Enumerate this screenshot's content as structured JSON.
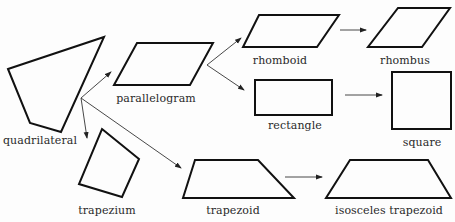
{
  "diagram": {
    "nodes": [
      {
        "id": "quadrilateral",
        "label": "quadrilateral"
      },
      {
        "id": "parallelogram",
        "label": "parallelogram"
      },
      {
        "id": "trapezium",
        "label": "trapezium"
      },
      {
        "id": "trapezoid",
        "label": "trapezoid"
      },
      {
        "id": "rhomboid",
        "label": "rhomboid"
      },
      {
        "id": "rectangle",
        "label": "rectangle"
      },
      {
        "id": "rhombus",
        "label": "rhombus"
      },
      {
        "id": "square",
        "label": "square"
      },
      {
        "id": "isosceles_trapezoid",
        "label": "isosceles trapezoid"
      }
    ],
    "edges": [
      {
        "from": "quadrilateral",
        "to": "parallelogram"
      },
      {
        "from": "quadrilateral",
        "to": "trapezium"
      },
      {
        "from": "quadrilateral",
        "to": "trapezoid"
      },
      {
        "from": "parallelogram",
        "to": "rhomboid"
      },
      {
        "from": "parallelogram",
        "to": "rectangle"
      },
      {
        "from": "rhomboid",
        "to": "rhombus"
      },
      {
        "from": "rectangle",
        "to": "square"
      },
      {
        "from": "trapezoid",
        "to": "isosceles_trapezoid"
      }
    ]
  },
  "labels": {
    "quadrilateral": "quadrilateral",
    "parallelogram": "parallelogram",
    "trapezium": "trapezium",
    "trapezoid": "trapezoid",
    "rhomboid": "rhomboid",
    "rectangle": "rectangle",
    "rhombus": "rhombus",
    "square": "square",
    "isosceles_trapezoid": "isosceles trapezoid"
  }
}
